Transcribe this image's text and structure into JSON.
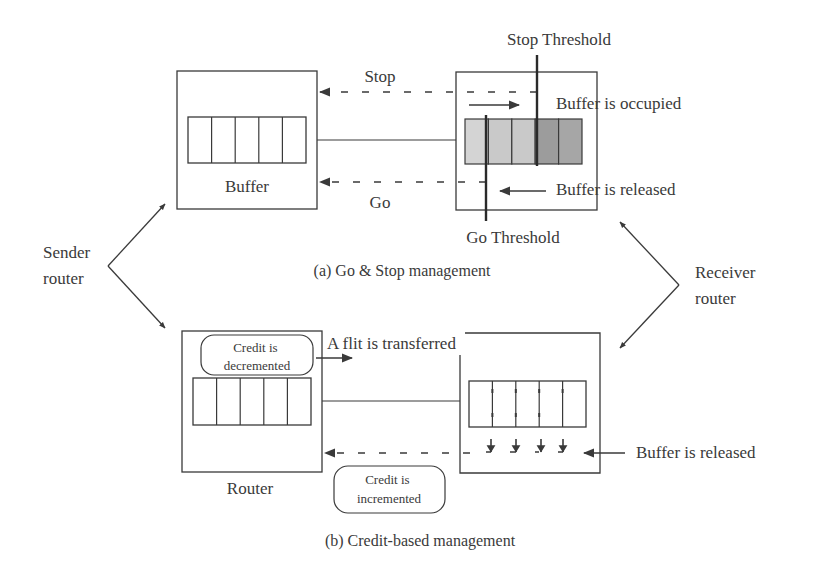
{
  "panel_a": {
    "caption": "(a) Go & Stop management",
    "sender_buffer_label": "Buffer",
    "stop_label": "Stop",
    "go_label": "Go",
    "stop_threshold_label": "Stop Threshold",
    "go_threshold_label": "Go Threshold",
    "buffer_occupied_label": "Buffer is occupied",
    "buffer_released_label": "Buffer is released",
    "receiver_cells": [
      {
        "fill": "#d4d4d4"
      },
      {
        "fill": "#c9c9c9"
      },
      {
        "fill": "#c9c9c9"
      },
      {
        "fill": "#9c9c9c"
      },
      {
        "fill": "#a6a6a6"
      }
    ],
    "sender_cell_count": 5
  },
  "panel_b": {
    "caption": "(b) Credit-based management",
    "sender_label": "Router",
    "credit_decremented_line1": "Credit is",
    "credit_decremented_line2": "decremented",
    "credit_incremented_line1": "Credit is",
    "credit_incremented_line2": "incremented",
    "flit_transferred_label": "A flit is transferred",
    "buffer_released_label": "Buffer is released",
    "sender_cell_count": 5,
    "receiver_cell_count": 5
  },
  "side_labels": {
    "sender_line1": "Sender",
    "sender_line2": "router",
    "receiver_line1": "Receiver",
    "receiver_line2": "router"
  },
  "colors": {
    "stroke": "#3a3a3a",
    "text": "#3a3a3a",
    "background": "#ffffff"
  }
}
